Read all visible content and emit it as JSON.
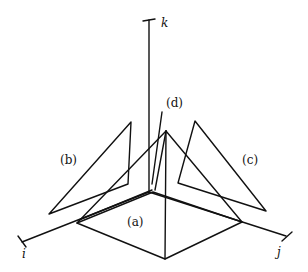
{
  "diagram": {
    "axes": {
      "i": "i",
      "j": "j",
      "k": "k"
    },
    "labels": {
      "a": "(a)",
      "b": "(b)",
      "c": "(c)",
      "d": "(d)"
    }
  }
}
